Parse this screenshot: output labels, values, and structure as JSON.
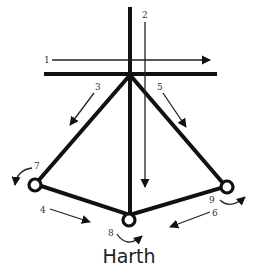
{
  "diagram": {
    "title": "Harth",
    "colors": {
      "stroke": "#111111",
      "label": "#333333",
      "background": "#ffffff"
    },
    "structure": {
      "vertical_member": "thick vertical line through apex down to bottom node",
      "horizontal_bar": "thick horizontal bar at apex",
      "left_leg": "apex to left node",
      "right_leg": "apex to right node",
      "base_left": "left node to bottom node",
      "base_right": "right node to bottom node",
      "nodes": [
        "left",
        "bottom",
        "right"
      ]
    },
    "arrows": [
      {
        "id": 1,
        "label": "1",
        "kind": "straight",
        "direction": "right"
      },
      {
        "id": 2,
        "label": "2",
        "kind": "straight",
        "direction": "down"
      },
      {
        "id": 3,
        "label": "3",
        "kind": "straight",
        "direction": "down-left"
      },
      {
        "id": 4,
        "label": "4",
        "kind": "straight",
        "direction": "down-right"
      },
      {
        "id": 5,
        "label": "5",
        "kind": "straight",
        "direction": "down-right"
      },
      {
        "id": 6,
        "label": "6",
        "kind": "straight",
        "direction": "down-left"
      },
      {
        "id": 7,
        "label": "7",
        "kind": "curved",
        "direction": "counter-clockwise",
        "at": "left node"
      },
      {
        "id": 8,
        "label": "8",
        "kind": "curved",
        "direction": "clockwise",
        "at": "bottom node"
      },
      {
        "id": 9,
        "label": "9",
        "kind": "curved",
        "direction": "counter-clockwise",
        "at": "right node"
      }
    ]
  }
}
